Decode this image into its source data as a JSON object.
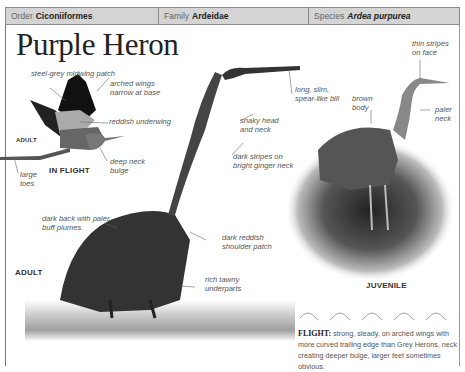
{
  "taxonomy": {
    "order_prefix": "Order",
    "order": "Ciconiiformes",
    "family_prefix": "Family",
    "family": "Ardeidae",
    "species_prefix": "Species",
    "species": "Ardea purpurea"
  },
  "title": "Purple Heron",
  "sections": {
    "in_flight": "IN FLIGHT",
    "adult_flight": "ADULT",
    "adult": "ADULT",
    "juvenile": "JUVENILE"
  },
  "annotations": {
    "flight": [
      {
        "id": "steel-grey",
        "text": "steel-grey midwing patch"
      },
      {
        "id": "arched-wings",
        "text": "arched wings narrow at base"
      },
      {
        "id": "reddish-underwing",
        "text": "reddish underwing"
      },
      {
        "id": "deep-neck",
        "text": "deep neck bulge"
      },
      {
        "id": "large-toes",
        "text": "large toes"
      }
    ],
    "adult": [
      {
        "id": "long-bill",
        "text": "long, slim, spear-like bill"
      },
      {
        "id": "snaky-head",
        "text": "snaky head and neck"
      },
      {
        "id": "dark-stripes",
        "text": "dark stripes on bright ginger neck"
      },
      {
        "id": "dark-back",
        "text": "dark back with paler, buff plumes"
      },
      {
        "id": "shoulder-patch",
        "text": "dark reddish shoulder patch"
      },
      {
        "id": "underparts",
        "text": "rich tawny underparts"
      }
    ],
    "juvenile": [
      {
        "id": "thin-stripes",
        "text": "thin stripes on face"
      },
      {
        "id": "brown-body",
        "text": "brown body"
      },
      {
        "id": "paler-neck",
        "text": "paler neck"
      }
    ]
  },
  "flight_note": {
    "heading": "FLIGHT:",
    "text": "strong, steady, on arched wings with more curved trailing edge than Grey Herons, neck creating deeper bulge, larger feet sometimes obvious."
  }
}
